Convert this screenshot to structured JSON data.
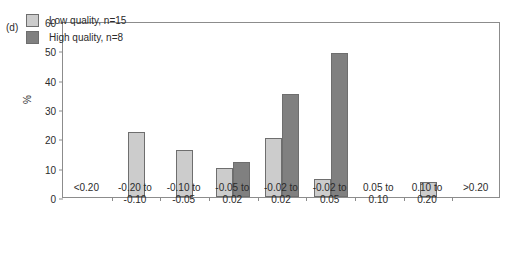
{
  "panel": {
    "label": "(d)"
  },
  "axes": {
    "ylabel": "%",
    "yticks": [
      "0",
      "10",
      "20",
      "30",
      "40",
      "50",
      "60"
    ],
    "ymin": 0,
    "ymax": 60
  },
  "legend": {
    "items": [
      {
        "label": "Low quality, n=15",
        "color": "#cccccc",
        "name": "low-quality"
      },
      {
        "label": "High quality, n=8",
        "color": "#808080",
        "name": "high-quality"
      }
    ]
  },
  "chart_data": {
    "type": "bar",
    "title": "",
    "xlabel": "",
    "ylabel": "%",
    "ylim": [
      0,
      60
    ],
    "grid": false,
    "legend_position": "top-left",
    "categories": [
      "<0.20",
      "-0.20 to -0.10",
      "-0.10 to -0.05",
      "-0.05 to 0.02",
      "-0.02 to 0.02",
      "-0.02 to 0.05",
      "0.05 to 0.10",
      "0.10 to 0.20",
      ">0.20"
    ],
    "category_lines": [
      [
        "<0.20",
        ""
      ],
      [
        "-0.20 to",
        "-0.10"
      ],
      [
        "-0.10 to",
        "-0.05"
      ],
      [
        "-0.05 to",
        "0.02"
      ],
      [
        "-0.02 to",
        "0.02"
      ],
      [
        "-0.02 to",
        "0.05"
      ],
      [
        "0.05 to",
        "0.10"
      ],
      [
        "0.10 to",
        "0.20"
      ],
      [
        ">0.20",
        ""
      ]
    ],
    "series": [
      {
        "name": "Low quality, n=15",
        "color": "#cccccc",
        "values": [
          0,
          22,
          16,
          10,
          20,
          6,
          0,
          5,
          0
        ]
      },
      {
        "name": "High quality, n=8",
        "color": "#808080",
        "values": [
          0,
          0,
          0,
          12,
          35,
          49,
          0,
          0,
          0
        ]
      }
    ]
  }
}
